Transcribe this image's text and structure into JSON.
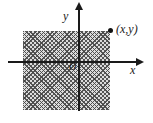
{
  "figure": {
    "type": "coordinate-plane-diagram",
    "labels": {
      "y_axis": "y",
      "x_axis": "x",
      "origin": "O",
      "point": "(x,y)"
    },
    "colors": {
      "background": "#ffffff",
      "axis": "#1a1a1a",
      "hatch_line": "#464646",
      "hatch_background": "#dcdcdc",
      "point": "#111111"
    }
  }
}
